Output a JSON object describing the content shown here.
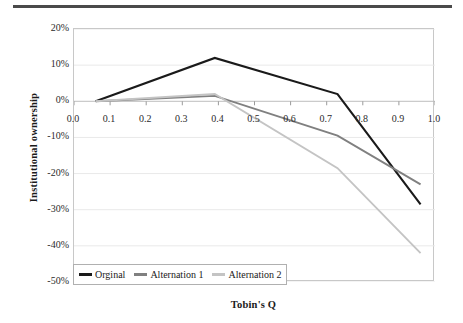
{
  "figure": {
    "top_rule": "horizontal-rule",
    "background_color": "#ffffff"
  },
  "chart_data": {
    "type": "line",
    "title": "",
    "subtitle": "",
    "xlabel": "Tobin's Q",
    "ylabel": "Institutional ownership",
    "xlim": [
      0.0,
      1.0
    ],
    "ylim": [
      -0.5,
      0.2
    ],
    "x_ticks": [
      0.0,
      0.1,
      0.2,
      0.3,
      0.4,
      0.5,
      0.6,
      0.7,
      0.8,
      0.9,
      1.0
    ],
    "x_tick_labels": [
      "0.0",
      "0.1",
      "0.2",
      "0.3",
      "0.4",
      "0.5",
      "0.6",
      "0.7",
      "0.8",
      "0.9",
      "1.0"
    ],
    "y_ticks": [
      0.2,
      0.1,
      0.0,
      -0.1,
      -0.2,
      -0.3,
      -0.4,
      -0.5
    ],
    "y_tick_labels": [
      "20%",
      "10%",
      "0%",
      "-10%",
      "-20%",
      "-30%",
      "-40%",
      "-50%"
    ],
    "grid": true,
    "grid_color": "#e9e9e9",
    "plot_border_color": "#c8c8c8",
    "zero_line_color": "#bdbdbd",
    "legend_position": "lower left",
    "x": [
      0.06,
      0.39,
      0.73,
      0.96
    ],
    "series": [
      {
        "name": "Orginal",
        "color": "#1a1a1a",
        "width": 2.1,
        "values": [
          0.0,
          0.12,
          0.02,
          -0.285
        ],
        "value_labels": [
          "0%",
          "12%",
          "2%",
          "-28.5%"
        ]
      },
      {
        "name": "Alternation 1",
        "color": "#808080",
        "width": 1.9,
        "values": [
          0.0,
          0.015,
          -0.095,
          -0.23
        ],
        "value_labels": [
          "0%",
          "1.5%",
          "-9.5%",
          "-23%"
        ]
      },
      {
        "name": "Alternation 2",
        "color": "#c4c4c4",
        "width": 1.9,
        "values": [
          0.0,
          0.02,
          -0.185,
          -0.42
        ],
        "value_labels": [
          "0%",
          "2%",
          "-18.5%",
          "-42%"
        ]
      }
    ]
  },
  "legend": {
    "entries": [
      {
        "label": "Orginal"
      },
      {
        "label": "Alternation 1"
      },
      {
        "label": "Alternation 2"
      }
    ]
  }
}
